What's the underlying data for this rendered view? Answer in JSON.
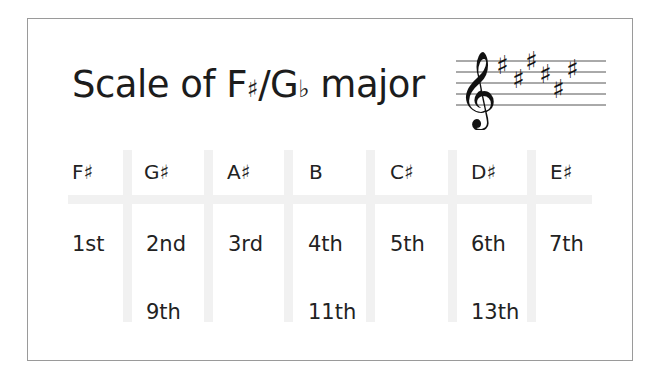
{
  "title": {
    "prefix": "Scale of F",
    "sharp": "♯",
    "slash": "/G",
    "flat": "♭",
    "suffix": " major"
  },
  "staff": {
    "clef": "treble-clef",
    "key_signature": "6 sharps",
    "sharps": [
      "F♯",
      "C♯",
      "G♯",
      "D♯",
      "A♯",
      "E♯"
    ]
  },
  "table": {
    "columns": [
      {
        "note": "F♯",
        "degree": "1st",
        "extension": ""
      },
      {
        "note": "G♯",
        "degree": "2nd",
        "extension": "9th"
      },
      {
        "note": "A♯",
        "degree": "3rd",
        "extension": ""
      },
      {
        "note": "B",
        "degree": "4th",
        "extension": "11th"
      },
      {
        "note": "C♯",
        "degree": "5th",
        "extension": ""
      },
      {
        "note": "D♯",
        "degree": "6th",
        "extension": "13th"
      },
      {
        "note": "E♯",
        "degree": "7th",
        "extension": ""
      }
    ]
  },
  "colors": {
    "text": "#1e1e1e",
    "frame_border": "#9a9a9a",
    "grid": "#f1f1f1"
  }
}
